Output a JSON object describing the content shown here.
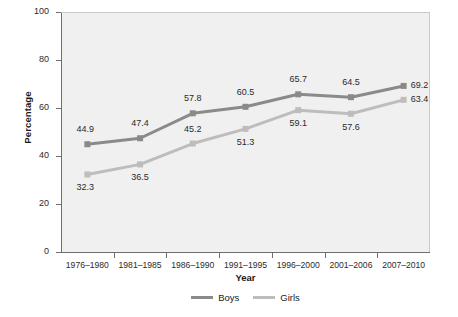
{
  "chart_data": {
    "type": "line",
    "title": "",
    "xlabel": "Year",
    "ylabel": "Percentage",
    "categories": [
      "1976–1980",
      "1981–1985",
      "1986–1990",
      "1991–1995",
      "1996–2000",
      "2001–2006",
      "2007–2010"
    ],
    "ylim": [
      0,
      100
    ],
    "yticks": [
      0,
      20,
      40,
      60,
      80,
      100
    ],
    "ytick_labels": [
      "0",
      "20",
      "40",
      "60",
      "80",
      "100"
    ],
    "grid": false,
    "legend_position": "bottom-center",
    "series": [
      {
        "name": "Boys",
        "color": "#8a8a8a",
        "marker": "square",
        "values": [
          44.9,
          47.4,
          57.8,
          60.5,
          65.7,
          64.5,
          69.2
        ],
        "value_labels": [
          "44.9",
          "47.4",
          "57.8",
          "60.5",
          "65.7",
          "64.5",
          "69.2"
        ],
        "label_positions": [
          "above-left",
          "above",
          "above",
          "above",
          "above",
          "above",
          "right"
        ]
      },
      {
        "name": "Girls",
        "color": "#bdbdbd",
        "marker": "square",
        "values": [
          32.3,
          36.5,
          45.2,
          51.3,
          59.1,
          57.6,
          63.4
        ],
        "value_labels": [
          "32.3",
          "36.5",
          "45.2",
          "51.3",
          "59.1",
          "57.6",
          "63.4"
        ],
        "label_positions": [
          "below-left",
          "below",
          "above",
          "below",
          "below",
          "below",
          "right"
        ]
      }
    ],
    "plot_background": "#f0f0f0",
    "axis_color": "#6e6e6e"
  },
  "legend": {
    "items": [
      {
        "label": "Boys"
      },
      {
        "label": "Girls"
      }
    ]
  }
}
